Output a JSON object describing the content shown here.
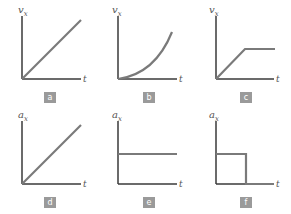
{
  "colors": {
    "curve": "#7a7a7a",
    "axis": "#3a3a3a",
    "badge_bg": "#9a9a9a",
    "badge_fg": "#ffffff"
  },
  "panels": [
    {
      "label": "a",
      "ylabel": "v",
      "ysub": "x",
      "xlabel": "t",
      "shape": "linear increasing velocity"
    },
    {
      "label": "b",
      "ylabel": "v",
      "ysub": "x",
      "xlabel": "t",
      "shape": "curved (quadratic) increasing velocity"
    },
    {
      "label": "c",
      "ylabel": "v",
      "ysub": "x",
      "xlabel": "t",
      "shape": "linear increase then constant velocity"
    },
    {
      "label": "d",
      "ylabel": "a",
      "ysub": "x",
      "xlabel": "t",
      "shape": "linear increasing acceleration"
    },
    {
      "label": "e",
      "ylabel": "a",
      "ysub": "x",
      "xlabel": "t",
      "shape": "constant acceleration"
    },
    {
      "label": "f",
      "ylabel": "a",
      "ysub": "x",
      "xlabel": "t",
      "shape": "constant acceleration then drops to zero"
    }
  ]
}
